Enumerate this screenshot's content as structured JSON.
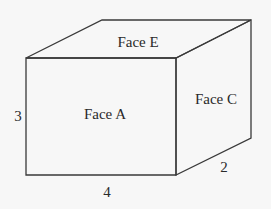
{
  "diagram": {
    "type": "rectangular-prism",
    "faces": {
      "front": "Face A",
      "top": "Face E",
      "side": "Face C"
    },
    "dimensions": {
      "height": "3",
      "length": "4",
      "depth": "2"
    },
    "colors": {
      "background": "#f7f7f7",
      "stroke": "#3a3a3a",
      "text": "#2a2a2a"
    }
  }
}
